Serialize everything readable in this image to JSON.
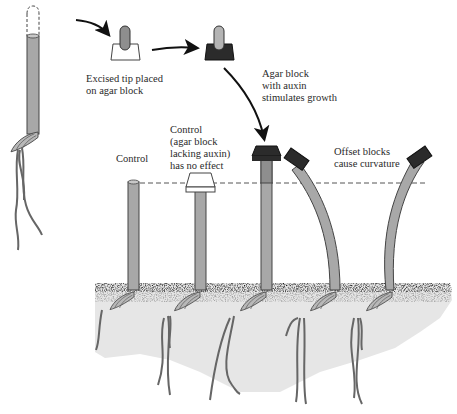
{
  "figure": {
    "colors": {
      "stem": "#a8a8a8",
      "stem_outline": "#444444",
      "block_plain": "#ffffff",
      "block_auxin": "#2b2b2b",
      "soil_surface": "#1e1e1e",
      "soil_body": "#e8e8e8",
      "tip": "#8e8e8e",
      "dashed_line": "#555555"
    },
    "labels": {
      "excised_tip": "Excised tip placed\non agar block",
      "agar_auxin": "Agar block\nwith auxin\nstimulates growth",
      "control_plain": "Control",
      "control_agar": "Control\n(agar block\nlacking auxin)\nhas no effect",
      "offset_blocks": "Offset blocks\ncause curvature"
    },
    "stages": [
      {
        "id": "decapitated-coleoptile",
        "description": "Coleoptile with tip removed (dashed outline)"
      },
      {
        "id": "tip-on-agar",
        "description": "Excised tip placed on plain agar block"
      },
      {
        "id": "auxin-block",
        "description": "Agar block containing auxin"
      }
    ],
    "seedlings": [
      {
        "id": "control",
        "cap": "none",
        "curvature": "none"
      },
      {
        "id": "control-agar",
        "cap": "plain-agar",
        "curvature": "none"
      },
      {
        "id": "auxin-centered",
        "cap": "auxin-agar",
        "curvature": "none",
        "effect": "elongated"
      },
      {
        "id": "auxin-offset-left",
        "cap": "auxin-agar-offset",
        "curvature": "bends-left"
      },
      {
        "id": "auxin-offset-right",
        "cap": "auxin-agar-offset",
        "curvature": "bends-right"
      }
    ]
  }
}
